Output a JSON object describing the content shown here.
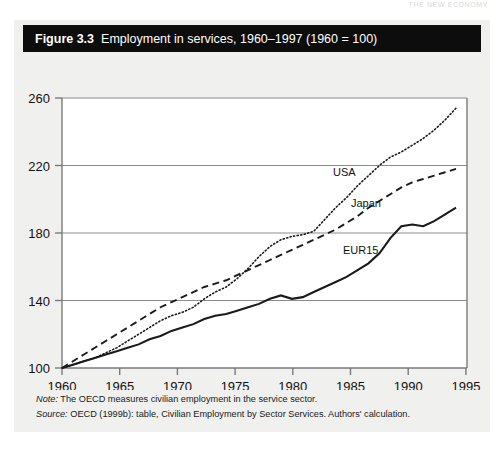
{
  "page_header": "THE NEW ECONOMY",
  "figure": {
    "number": "Figure 3.3",
    "title": "Employment in services, 1960–1997 (1960 = 100)"
  },
  "notes": {
    "note_label": "Note:",
    "note_text": "The OECD measures civilian employment in the service sector.",
    "source_label": "Source:",
    "source_text": "OECD (1999b): table, Civilian Employment by Sector Services. Authors' calculation."
  },
  "axis": {
    "y_ticks": [
      "100",
      "140",
      "180",
      "220",
      "260"
    ],
    "x_ticks": [
      "1960",
      "1965",
      "1970",
      "1975",
      "1980",
      "1985",
      "1990",
      "1995"
    ]
  },
  "series_labels": {
    "usa": "USA",
    "japan": "Japan",
    "eur15": "EUR15"
  },
  "colors": {
    "title_bar": "#0d0d0d",
    "panel": "#f0f0ef",
    "plot_bg": "#ffffff",
    "axis": "#7a7a7a",
    "gridline": "#8c8c8c",
    "line": "#1a1a1a"
  },
  "chart_data": {
    "type": "line",
    "title": "Employment in services, 1960–1997 (1960 = 100)",
    "xlabel": "",
    "ylabel": "",
    "xlim": [
      1960,
      1997
    ],
    "ylim": [
      100,
      260
    ],
    "grid": true,
    "grid_axis": "y",
    "legend": "inline-labels",
    "yticks": [
      100,
      140,
      180,
      220,
      260
    ],
    "xticks": [
      1960,
      1965,
      1970,
      1975,
      1980,
      1985,
      1990,
      1995
    ],
    "x": [
      1960,
      1961,
      1962,
      1963,
      1964,
      1965,
      1966,
      1967,
      1968,
      1969,
      1970,
      1971,
      1972,
      1973,
      1974,
      1975,
      1976,
      1977,
      1978,
      1979,
      1980,
      1981,
      1982,
      1983,
      1984,
      1985,
      1986,
      1987,
      1988,
      1989,
      1990,
      1991,
      1992,
      1993,
      1994,
      1995,
      1996
    ],
    "series": [
      {
        "name": "USA",
        "style": "dotted",
        "values": [
          100,
          102,
          104,
          106,
          109,
          112,
          116,
          120,
          124,
          128,
          131,
          133,
          136,
          141,
          145,
          148,
          153,
          159,
          166,
          172,
          176,
          178,
          179,
          181,
          188,
          195,
          201,
          208,
          214,
          220,
          225,
          228,
          232,
          236,
          241,
          247,
          254
        ]
      },
      {
        "name": "Japan",
        "style": "dashed",
        "values": [
          100,
          104,
          108,
          112,
          116,
          120,
          124,
          128,
          132,
          136,
          139,
          142,
          145,
          148,
          150,
          152,
          155,
          158,
          161,
          164,
          167,
          170,
          173,
          176,
          179,
          182,
          186,
          190,
          195,
          199,
          203,
          207,
          210,
          212,
          214,
          216,
          218
        ]
      },
      {
        "name": "EUR15",
        "style": "solid",
        "values": [
          100,
          102,
          104,
          106,
          108,
          110,
          112,
          114,
          117,
          119,
          122,
          124,
          126,
          129,
          131,
          132,
          134,
          136,
          138,
          141,
          143,
          141,
          142,
          145,
          148,
          151,
          154,
          158,
          162,
          168,
          177,
          184,
          185,
          184,
          187,
          191,
          195
        ]
      }
    ]
  }
}
